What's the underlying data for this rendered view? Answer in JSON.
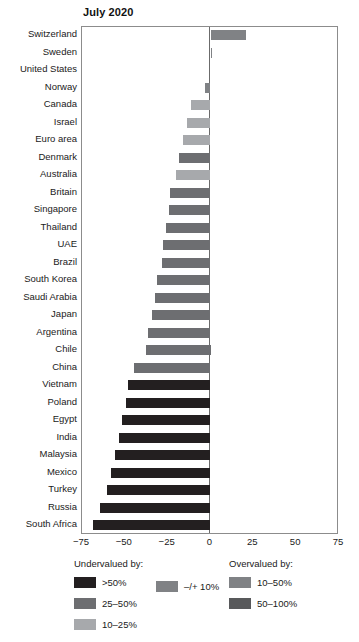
{
  "chart_data": {
    "type": "bar",
    "orientation": "horizontal",
    "title": "July 2020",
    "xlabel": "",
    "ylabel": "",
    "xlim": [
      -75,
      75
    ],
    "xticks": [
      "−75",
      "−50",
      "−25",
      "0",
      "25",
      "50",
      "75"
    ],
    "xtick_values": [
      -75,
      -50,
      -25,
      0,
      25,
      50,
      75
    ],
    "grid": false,
    "legend_position": "bottom",
    "zero_reference_line": true,
    "categories": [
      "Switzerland",
      "Sweden",
      "United States",
      "Norway",
      "Canada",
      "Israel",
      "Euro area",
      "Denmark",
      "Australia",
      "Britain",
      "Singapore",
      "Thailand",
      "UAE",
      "Brazil",
      "South Korea",
      "Saudi Arabia",
      "Japan",
      "Argentina",
      "Chile",
      "China",
      "Vietnam",
      "Poland",
      "Egypt",
      "India",
      "Malaysia",
      "Mexico",
      "Turkey",
      "Russia",
      "South Africa"
    ],
    "values": [
      20.5,
      1.0,
      0.0,
      -3.5,
      -11.5,
      -14.0,
      -16.0,
      -18.5,
      -20.0,
      -23.5,
      -24.5,
      -26.0,
      -27.5,
      -28.5,
      -31.0,
      -32.5,
      -34.0,
      -36.5,
      -37.5,
      -44.5,
      -48.0,
      -49.5,
      -51.5,
      -53.5,
      -56.0,
      -58.0,
      -60.5,
      -64.5,
      -68.5
    ],
    "bar_bands": [
      "over_10_50",
      "pm_10",
      "pm_10",
      "pm_10",
      "under_10_25",
      "under_10_25",
      "under_10_25",
      "under_25_50",
      "under_10_25",
      "under_25_50",
      "under_25_50",
      "under_25_50",
      "under_25_50",
      "under_25_50",
      "under_25_50",
      "under_25_50",
      "under_25_50",
      "under_25_50",
      "under_25_50",
      "under_25_50",
      "under_gt_50",
      "under_gt_50",
      "under_gt_50",
      "under_gt_50",
      "under_gt_50",
      "under_gt_50",
      "under_gt_50",
      "under_gt_50",
      "under_gt_50"
    ]
  },
  "colors": {
    "under_gt_50": "#231f20",
    "under_25_50": "#6d6e71",
    "under_10_25": "#a7a9ac",
    "pm_10": "#808285",
    "over_10_50": "#808285",
    "over_50_100": "#58595b",
    "frame": "#8c8c8c",
    "zero_line": "#6b6b6b",
    "text": "#1a1a1a",
    "background": "#ffffff"
  },
  "legend": {
    "undervalued": {
      "heading": "Undervalued by:",
      "items": [
        {
          "label": ">50%",
          "color_key": "under_gt_50"
        },
        {
          "label": "25–50%",
          "color_key": "under_25_50"
        },
        {
          "label": "10–25%",
          "color_key": "under_10_25"
        }
      ]
    },
    "neutral": {
      "items": [
        {
          "label": "–/+ 10%",
          "color_key": "pm_10"
        }
      ]
    },
    "overvalued": {
      "heading": "Overvalued by:",
      "items": [
        {
          "label": "10–50%",
          "color_key": "over_10_50"
        },
        {
          "label": "50–100%",
          "color_key": "over_50_100"
        }
      ]
    }
  }
}
